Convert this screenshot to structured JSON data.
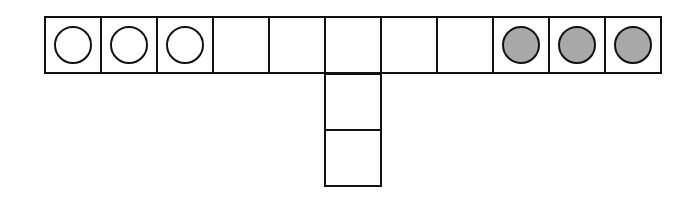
{
  "puzzle": {
    "title": "",
    "grid": {
      "origin_x": 44,
      "origin_y": 16,
      "cell_size": 56,
      "row_cells": 11,
      "stem_column": 5,
      "stem_cells": 2
    },
    "colors": {
      "line": "#111111",
      "white_piece": "#ffffff",
      "gray_piece": "#a8a8a8",
      "background": "#ffffff"
    },
    "row": [
      {
        "index": 0,
        "piece": "white"
      },
      {
        "index": 1,
        "piece": "white"
      },
      {
        "index": 2,
        "piece": "white"
      },
      {
        "index": 3,
        "piece": "empty"
      },
      {
        "index": 4,
        "piece": "empty"
      },
      {
        "index": 5,
        "piece": "empty"
      },
      {
        "index": 6,
        "piece": "empty"
      },
      {
        "index": 7,
        "piece": "empty"
      },
      {
        "index": 8,
        "piece": "gray"
      },
      {
        "index": 9,
        "piece": "gray"
      },
      {
        "index": 10,
        "piece": "gray"
      }
    ],
    "stem": [
      {
        "index": 0,
        "piece": "empty"
      },
      {
        "index": 1,
        "piece": "empty"
      }
    ]
  }
}
